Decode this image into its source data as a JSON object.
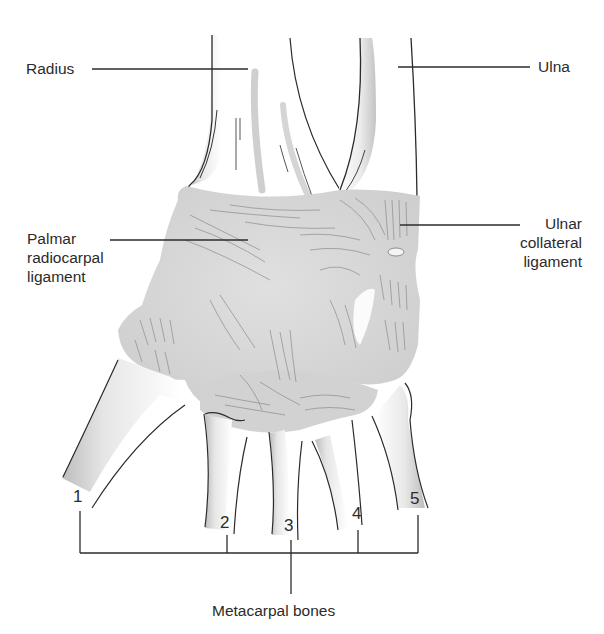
{
  "diagram": {
    "labels": {
      "radius": "Radius",
      "ulna": "Ulna",
      "palmar_radiocarpal_ligament": [
        "Palmar",
        "radiocarpal",
        "ligament"
      ],
      "ulnar_collateral_ligament": [
        "Ulnar",
        "collateral",
        "ligament"
      ],
      "metacarpal_bones": "Metacarpal bones"
    },
    "metacarpal_numbers": [
      "1",
      "2",
      "3",
      "4",
      "5"
    ]
  },
  "colors": {
    "line": "#2b2b2b",
    "ligament_fill": "#d9d9d9",
    "bone_shade": "#c8c8c8",
    "background": "#ffffff"
  }
}
